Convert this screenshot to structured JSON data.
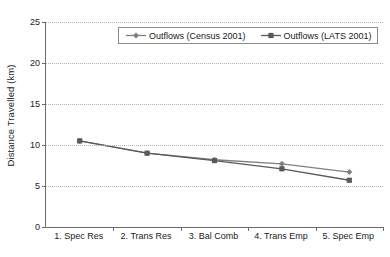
{
  "chart_data": {
    "type": "line",
    "title": "",
    "xlabel": "",
    "ylabel": "Distance Travelled (km)",
    "ylim": [
      0,
      25
    ],
    "yticks": [
      0,
      5,
      10,
      15,
      20,
      25
    ],
    "grid": true,
    "legend_position": "top-center",
    "categories": [
      "1. Spec Res",
      "2. Trans Res",
      "3. Bal Comb",
      "4. Trans Emp",
      "5. Spec Emp"
    ],
    "series": [
      {
        "name": "Outflows (Census 2001)",
        "marker": "diamond",
        "color": "#808080",
        "values": [
          10.5,
          9.0,
          8.2,
          7.7,
          6.7
        ]
      },
      {
        "name": "Outflows (LATS 2001)",
        "marker": "square",
        "color": "#595959",
        "values": [
          10.5,
          9.0,
          8.1,
          7.1,
          5.7
        ]
      }
    ]
  },
  "axis": {
    "y_title": "Distance Travelled (km)",
    "y_tick_labels": [
      "0",
      "5",
      "10",
      "15",
      "20",
      "25"
    ],
    "x_tick_labels": [
      "1. Spec Res",
      "2. Trans Res",
      "3. Bal Comb",
      "4. Trans Emp",
      "5. Spec Emp"
    ]
  },
  "legend": {
    "entries": [
      {
        "label": "Outflows (Census 2001)"
      },
      {
        "label": "Outflows (LATS 2001)"
      }
    ]
  },
  "colors": {
    "series_1": "#808080",
    "series_2": "#595959",
    "axis": "#6b6b6b",
    "grid": "#b3b3b3",
    "text": "#1a1a1a",
    "background": "#ffffff"
  }
}
